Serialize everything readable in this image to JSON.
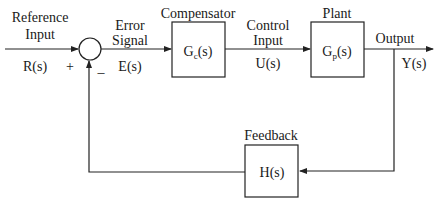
{
  "diagram": {
    "type": "feedback-control-loop",
    "reference": {
      "line1": "Reference",
      "line2": "Input",
      "symbol": "R(s)"
    },
    "summing_junction": {
      "plus_sign": "+",
      "minus_sign": "_"
    },
    "error": {
      "line1": "Error",
      "line2": "Signal",
      "symbol": "E(s)"
    },
    "compensator": {
      "title": "Compensator",
      "tf_main": "G",
      "tf_sub": "c",
      "tf_arg": "(s)"
    },
    "control": {
      "line1": "Control",
      "line2": "Input",
      "symbol": "U(s)"
    },
    "plant": {
      "title": "Plant",
      "tf_main": "G",
      "tf_sub": "p",
      "tf_arg": "(s)"
    },
    "output": {
      "label": "Output",
      "symbol": "Y(s)"
    },
    "feedback": {
      "title": "Feedback",
      "tf": "H(s)"
    },
    "colors": {
      "line": "#222222",
      "text": "#1a1a1a",
      "background": "#ffffff"
    }
  }
}
